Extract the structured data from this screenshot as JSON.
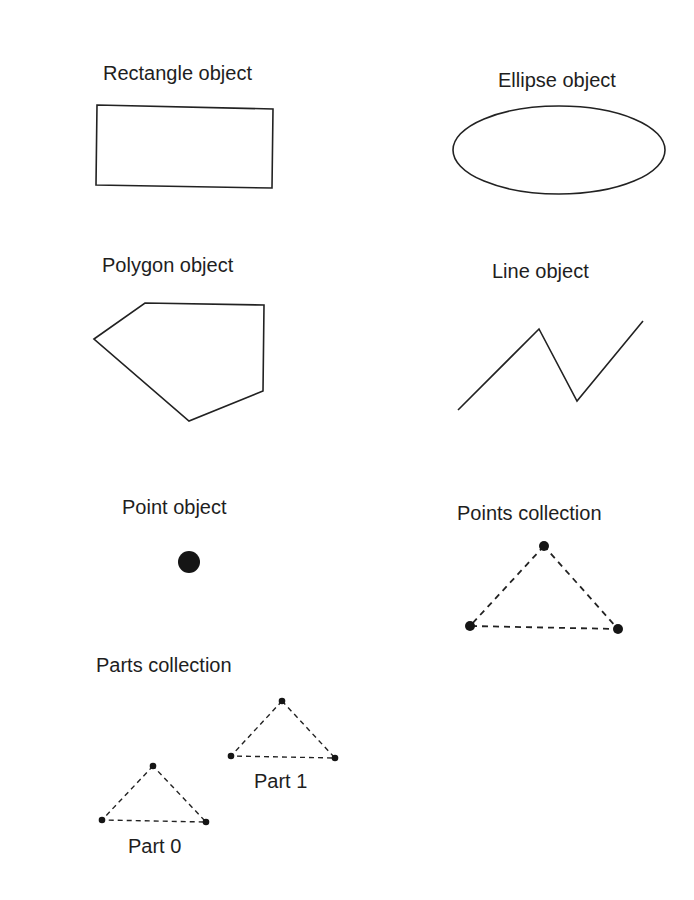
{
  "figure": {
    "stroke_color": "#1e1e1e",
    "background": "#ffffff"
  },
  "objects": {
    "rectangle": {
      "label": "Rectangle object",
      "shape": "rectangle"
    },
    "ellipse": {
      "label": "Ellipse object",
      "shape": "ellipse"
    },
    "polygon": {
      "label": "Polygon object",
      "shape": "polygon",
      "vertices": [
        [
          94,
          339
        ],
        [
          145,
          303
        ],
        [
          264,
          305
        ],
        [
          263,
          391
        ],
        [
          189,
          421
        ]
      ]
    },
    "line": {
      "label": "Line object",
      "shape": "polyline",
      "vertices": [
        [
          458,
          410
        ],
        [
          539,
          329
        ],
        [
          577,
          401
        ],
        [
          643,
          321
        ]
      ]
    },
    "point": {
      "label": "Point object",
      "shape": "point"
    },
    "points_collection": {
      "label": "Points collection",
      "shape": "multipoint",
      "vertices": [
        [
          544,
          546
        ],
        [
          470,
          626
        ],
        [
          618,
          629
        ]
      ]
    },
    "parts_collection": {
      "label": "Parts collection",
      "parts": [
        {
          "label": "Part 0",
          "vertices": [
            [
              153,
              766
            ],
            [
              102,
              820
            ],
            [
              206,
              822
            ]
          ]
        },
        {
          "label": "Part 1",
          "vertices": [
            [
              282,
              701
            ],
            [
              231,
              756
            ],
            [
              335,
              758
            ]
          ]
        }
      ]
    }
  }
}
